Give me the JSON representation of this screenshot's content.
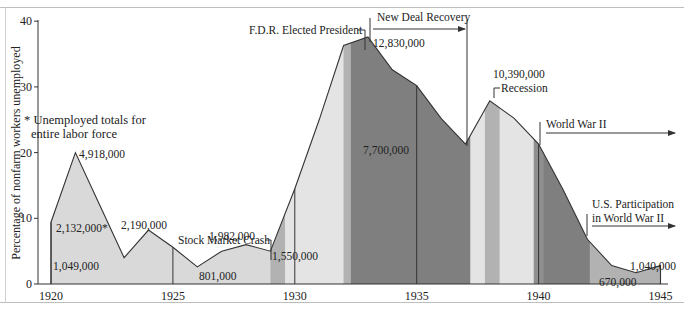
{
  "chart_data": {
    "type": "area",
    "title": "",
    "xlabel": "",
    "ylabel": "Percentage of nonfarm workers unemployed",
    "ylim": [
      0,
      40
    ],
    "xlim": [
      1920,
      1945
    ],
    "yticks": [
      "0",
      "10",
      "20",
      "30",
      "40"
    ],
    "xticks": [
      "1920",
      "1925",
      "1930",
      "1935",
      "1940",
      "1945"
    ],
    "grid": false,
    "legend": null,
    "footnote": "* Unemployed totals for entire labor force",
    "x": [
      1920,
      1921,
      1922,
      1923,
      1924,
      1925,
      1926,
      1927,
      1928,
      1929,
      1930,
      1931,
      1932,
      1933,
      1934,
      1935,
      1936,
      1937,
      1938,
      1939,
      1940,
      1941,
      1942,
      1943,
      1944,
      1945
    ],
    "series": [
      {
        "name": "Percentage of nonfarm workers unemployed",
        "values": [
          9.4,
          20.0,
          12.0,
          4.0,
          8.2,
          5.6,
          2.6,
          5.0,
          6.0,
          5.0,
          14.5,
          25.0,
          36.3,
          37.6,
          32.6,
          30.2,
          25.2,
          21.3,
          27.9,
          25.2,
          21.3,
          14.4,
          6.8,
          2.8,
          1.7,
          2.8
        ]
      }
    ],
    "data_labels": [
      {
        "year": 1920,
        "text": "2,132,000*"
      },
      {
        "year": 1921,
        "text": "4,918,000"
      },
      {
        "year": 1923,
        "text": "1,049,000"
      },
      {
        "year": 1924,
        "text": "2,190,000"
      },
      {
        "year": 1926,
        "text": "801,000"
      },
      {
        "year": 1928,
        "text": "1,982,000"
      },
      {
        "year": 1929,
        "text": "1,550,000"
      },
      {
        "year": 1933,
        "text": "12,830,000"
      },
      {
        "year": 1937,
        "text": "7,700,000"
      },
      {
        "year": 1938,
        "text": "10,390,000"
      },
      {
        "year": 1944,
        "text": "670,000"
      },
      {
        "year": 1945,
        "text": "1,040,000"
      }
    ],
    "annotations": [
      {
        "text": "Stock Market Crash",
        "year": 1929.8
      },
      {
        "text": "F.D.R. Elected President",
        "year": 1932.9
      },
      {
        "text": "New Deal Recovery",
        "from": 1933,
        "to": 1937.2,
        "arrow": true
      },
      {
        "text": "Recession",
        "year": 1938
      },
      {
        "text": "World War II",
        "from": 1939.9,
        "to": 1945,
        "arrow": true
      },
      {
        "text": "U.S. Participation in World War II",
        "from": 1941.9,
        "to": 1945,
        "arrow": true
      }
    ],
    "shaded_periods": [
      {
        "from": 1920,
        "to": 1929,
        "shade": "light"
      },
      {
        "from": 1929,
        "to": 1929.6,
        "shade": "medium"
      },
      {
        "from": 1929.6,
        "to": 1932,
        "shade": "lightest"
      },
      {
        "from": 1932,
        "to": 1932.3,
        "shade": "medium"
      },
      {
        "from": 1932.3,
        "to": 1937.2,
        "shade": "dark"
      },
      {
        "from": 1937.2,
        "to": 1937.8,
        "shade": "lightest"
      },
      {
        "from": 1937.8,
        "to": 1938.4,
        "shade": "medium"
      },
      {
        "from": 1938.4,
        "to": 1939.8,
        "shade": "lightest"
      },
      {
        "from": 1939.8,
        "to": 1940.2,
        "shade": "darkish"
      },
      {
        "from": 1940.2,
        "to": 1942.1,
        "shade": "dark"
      },
      {
        "from": 1942.1,
        "to": 1945,
        "shade": "medium"
      }
    ],
    "colors": {
      "light": "#d9d9d9",
      "lightest": "#e4e4e4",
      "medium": "#b2b2b2",
      "darkish": "#8f8f8f",
      "dark": "#7f7f7f",
      "line": "#333333"
    }
  }
}
